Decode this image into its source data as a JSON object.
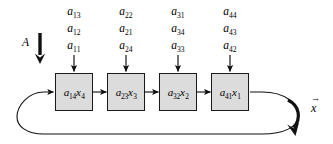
{
  "figure": {
    "input_label": "A",
    "output_label": "x",
    "output_vector_arrow": "→"
  },
  "coefficient_columns": [
    {
      "column_index": 1,
      "labels": [
        {
          "base": "a",
          "sub": "13"
        },
        {
          "base": "a",
          "sub": "12"
        },
        {
          "base": "a",
          "sub": "11"
        }
      ]
    },
    {
      "column_index": 2,
      "labels": [
        {
          "base": "a",
          "sub": "22"
        },
        {
          "base": "a",
          "sub": "21"
        },
        {
          "base": "a",
          "sub": "24"
        }
      ]
    },
    {
      "column_index": 3,
      "labels": [
        {
          "base": "a",
          "sub": "31"
        },
        {
          "base": "a",
          "sub": "34"
        },
        {
          "base": "a",
          "sub": "33"
        }
      ]
    },
    {
      "column_index": 4,
      "labels": [
        {
          "base": "a",
          "sub": "44"
        },
        {
          "base": "a",
          "sub": "43"
        },
        {
          "base": "a",
          "sub": "42"
        }
      ]
    }
  ],
  "boxes": [
    {
      "index": 1,
      "coef_base": "a",
      "coef_sub": "14",
      "var_base": "x",
      "var_sub": "4"
    },
    {
      "index": 2,
      "coef_base": "a",
      "coef_sub": "23",
      "var_base": "x",
      "var_sub": "3"
    },
    {
      "index": 3,
      "coef_base": "a",
      "coef_sub": "32",
      "var_base": "x",
      "var_sub": "2"
    },
    {
      "index": 4,
      "coef_base": "a",
      "coef_sub": "41",
      "var_base": "x",
      "var_sub": "1"
    }
  ],
  "colors": {
    "box_fill": "#dcdcdc",
    "stroke": "#1a1a1a",
    "background": "#ffffff"
  }
}
